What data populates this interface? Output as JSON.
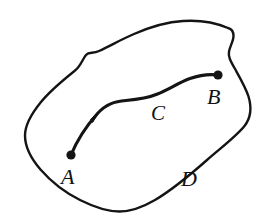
{
  "figure": {
    "type": "region-with-oriented-curve",
    "background_color": "#ffffff",
    "ink_color": "#141414",
    "labels": {
      "start_point": "A",
      "end_point": "B",
      "curve": "C",
      "region": "D"
    },
    "elements": {
      "region_boundary_name": "closed-region-outline",
      "curve_name": "directed-curve-from-A-to-B",
      "arrow_direction": "from A toward B",
      "start_marker": "filled-dot",
      "end_marker": "filled-dot"
    },
    "geometry": {
      "region_outline_path": "M 228 28 C 214 22 198 20 183 21 C 166 22 150 27 134 34 C 122 39 110 46 99 51 C 93 54 89 52 86 55 C 82 59 80 66 74 71 C 62 81 50 91 41 102 C 32 113 25 124 25 135 C 25 146 31 158 40 169 C 50 181 64 192 80 200 C 94 207 107 211 119 211 C 131 211 143 207 155 200 C 172 190 190 175 207 160 C 222 147 236 136 244 126 C 251 117 251 107 248 97 C 245 87 239 77 234 68 C 230 61 228 57 229 52 C 230 46 233 41 233 36 C 233 32 231 29 228 28 Z",
      "curve_path": "M 71 155 C 77 141 86 126 97 113 C 106 103 114 101 126 100 C 138 99 148 98 157 94 C 168 89 179 82 190 78 C 200 74 210 74 218 75",
      "arrow_tip": [
        98,
        112
      ],
      "point_A": [
        71,
        155
      ],
      "point_B": [
        218,
        75
      ],
      "label_positions": {
        "A": [
          70,
          180
        ],
        "B": [
          217,
          100
        ],
        "C": [
          159,
          117
        ],
        "D": [
          190,
          182
        ]
      }
    }
  }
}
